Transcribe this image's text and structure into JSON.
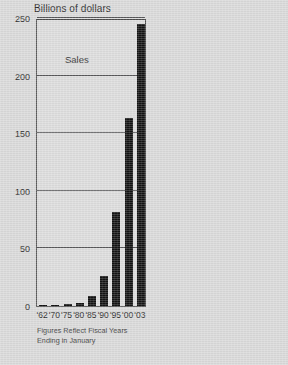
{
  "chart_data": {
    "type": "bar",
    "title": "Billions of dollars",
    "series_label": "Sales",
    "xlabel": "",
    "ylabel": "",
    "categories": [
      "'62",
      "'70",
      "'75",
      "'80",
      "'85",
      "'90",
      "'95",
      "'00",
      "'03"
    ],
    "values": [
      0.03,
      1,
      1.5,
      2.5,
      8.5,
      26,
      82,
      163,
      245
    ],
    "ylim": [
      0,
      250
    ],
    "yticks": [
      0,
      50,
      100,
      150,
      200,
      250
    ],
    "ytick_labels": [
      "0",
      "50",
      "100",
      "150",
      "200",
      "250"
    ],
    "grid": true,
    "legend": false,
    "bar_color": "#121212",
    "plot_background": "#dcdcdc",
    "page_background": "#d9d9d9",
    "axis_color": "#4a4a4a",
    "gridline_color": "#58585a",
    "annotations": [
      "Figures Reflect Fiscal Years",
      "Ending in January"
    ]
  },
  "footnote": {
    "line1": "Figures Reflect Fiscal Years",
    "line2": "Ending in January"
  }
}
